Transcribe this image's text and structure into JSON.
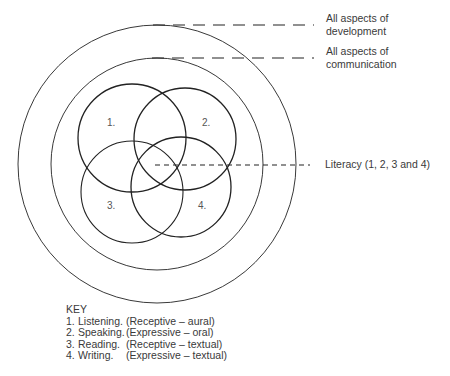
{
  "diagram": {
    "type": "nested-venn",
    "outer_circle_label": [
      "All aspects of",
      "development"
    ],
    "middle_circle_label": [
      "All aspects of",
      "communication"
    ],
    "overlap_label": "Literacy (1, 2, 3 and 4)",
    "circle_numbers": [
      "1.",
      "2.",
      "3.",
      "4."
    ],
    "line_color": "#222222",
    "text_color": "#3a3a3a"
  },
  "key": {
    "title": "KEY",
    "items": [
      {
        "num": "1.",
        "name": "Listening.",
        "desc": "(Receptive – aural)"
      },
      {
        "num": "2.",
        "name": "Speaking.",
        "desc": "(Expressive – oral)"
      },
      {
        "num": "3.",
        "name": "Reading.",
        "desc": "(Receptive – textual)"
      },
      {
        "num": "4.",
        "name": "Writing.",
        "desc": "(Expressive – textual)"
      }
    ]
  }
}
